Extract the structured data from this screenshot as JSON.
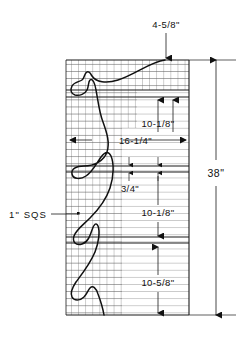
{
  "drawing": {
    "title": "Mesh panel elevation drawing",
    "background_color": "#ffffff",
    "line_color": "#1a1a1a",
    "grid_color": "#555555",
    "wire_color": "#111111"
  },
  "dimensions": {
    "top_offset": {
      "label": "4-5/8\"",
      "name": "top-offset-dimension"
    },
    "upper_rail_gap": {
      "label": "10-1/8\"",
      "name": "upper-rail-dimension"
    },
    "panel_width": {
      "label": "16-1/4\"",
      "name": "panel-width-dimension"
    },
    "rail_thickness": {
      "label": "3/4\"",
      "name": "rail-thickness-dimension"
    },
    "middle_rail_gap": {
      "label": "10-1/8\"",
      "name": "middle-rail-dimension"
    },
    "lower_rail_gap": {
      "label": "10-5/8\"",
      "name": "lower-rail-dimension"
    },
    "overall_height": {
      "label": "38\"",
      "name": "overall-height-dimension"
    }
  },
  "annotations": {
    "mesh_callout": {
      "label": "1\" SQS",
      "name": "mesh-size-callout"
    }
  },
  "geometry": {
    "mesh_left": 66,
    "mesh_right": 189,
    "mesh_top": 60,
    "mesh_bottom": 315,
    "grid_pitch": 7.1,
    "rails": [
      90,
      97,
      166,
      172,
      237,
      243
    ],
    "extension_lines": [
      60,
      97,
      166,
      237,
      315
    ]
  }
}
